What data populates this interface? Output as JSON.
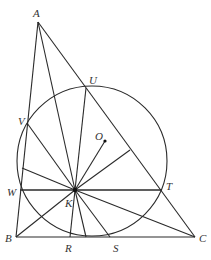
{
  "diagram": {
    "type": "geometry",
    "points": {
      "A": {
        "x": 38,
        "y": 22,
        "label": "A",
        "lx": 33,
        "ly": 17
      },
      "B": {
        "x": 16,
        "y": 237,
        "label": "B",
        "lx": 5,
        "ly": 242
      },
      "C": {
        "x": 195,
        "y": 237,
        "label": "C",
        "lx": 199,
        "ly": 242
      },
      "K": {
        "x": 75,
        "y": 190,
        "label": "K",
        "lx": 65,
        "ly": 207
      },
      "O": {
        "x": 105,
        "y": 141,
        "label": "O",
        "lx": 95,
        "ly": 140
      },
      "U": {
        "x": 86,
        "y": 88,
        "label": "U",
        "lx": 89,
        "ly": 84
      },
      "V": {
        "x": 27,
        "y": 123,
        "label": "V",
        "lx": 18,
        "ly": 125
      },
      "W": {
        "x": 20,
        "y": 190,
        "label": "W",
        "lx": 7,
        "ly": 196
      },
      "T": {
        "x": 162,
        "y": 190,
        "label": "T",
        "lx": 166,
        "ly": 190
      },
      "R": {
        "x": 70,
        "y": 237,
        "label": "R",
        "lx": 65,
        "ly": 252
      },
      "S": {
        "x": 110,
        "y": 237,
        "label": "S",
        "lx": 113,
        "ly": 252
      }
    },
    "circle": {
      "cx": 92,
      "cy": 161,
      "r": 75
    },
    "segments": [
      [
        "A",
        "B"
      ],
      [
        "B",
        "C"
      ],
      [
        "C",
        "A"
      ],
      [
        "W",
        "T"
      ],
      [
        "U",
        "K"
      ],
      [
        "V",
        "K"
      ],
      [
        "W",
        "K"
      ],
      [
        "T",
        "K"
      ],
      [
        "R",
        "K"
      ],
      [
        "S",
        "K"
      ],
      [
        "K",
        "O"
      ],
      [
        "B",
        "K"
      ],
      [
        "C",
        "K"
      ],
      [
        "A",
        "K"
      ]
    ],
    "extra_lines": [
      {
        "x1": 22,
        "y1": 168,
        "x2": 75,
        "y2": 190
      },
      {
        "x1": 75,
        "y1": 190,
        "x2": 86,
        "y2": 237
      },
      {
        "x1": 75,
        "y1": 190,
        "x2": 130,
        "y2": 150
      }
    ]
  }
}
